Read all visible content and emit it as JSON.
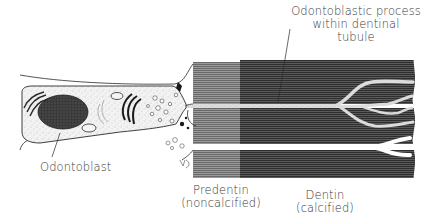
{
  "diagram": {
    "type": "biological-illustration",
    "labels": {
      "odontoblast": "Odontoblast",
      "process_line1": "Odontoblastic process",
      "process_line2": "within dentinal",
      "process_line3": "tubule",
      "predentin_line1": "Predentin",
      "predentin_line2": "(noncalcified)",
      "dentin_line1": "Dentin",
      "dentin_line2": "(calcified)"
    },
    "regions": [
      {
        "name": "Odontoblast",
        "description": "cell body with nucleus, Golgi, ER, mitochondria, vesicles"
      },
      {
        "name": "Predentin",
        "state": "noncalcified",
        "shade": "lighter gray striations"
      },
      {
        "name": "Dentin",
        "state": "calcified",
        "shade": "dark gray striations"
      },
      {
        "name": "Odontoblastic process within dentinal tubule",
        "description": "stippled branching process running through dentin"
      }
    ],
    "colors": {
      "ink": "#2a2a2a",
      "predentin": "#8a8a8a",
      "dentin": "#4a4a4a",
      "cytoplasm": "#f1f1f1",
      "nucleus": "#3a3a3a",
      "tubule": "#ffffff"
    }
  }
}
